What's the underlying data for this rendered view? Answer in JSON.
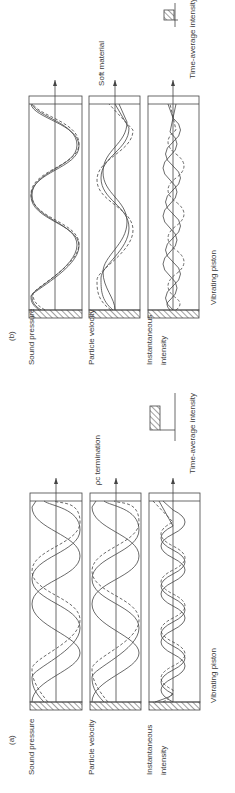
{
  "figure": {
    "rotation": "90deg counter-clockwise",
    "stroke_color": "#4a4a4a",
    "background": "#ffffff"
  },
  "panel_a": {
    "label": "(a)",
    "rows": [
      {
        "label": "Sound pressure"
      },
      {
        "label": "Particle velocity"
      },
      {
        "label_line1": "Instantaneous",
        "label_line2": "intensity"
      }
    ],
    "source_label": "Vibrating piston",
    "termination_label": "ρc termination",
    "legend_label": "Time-average intensity"
  },
  "panel_b": {
    "label": "(b)",
    "rows": [
      {
        "label": "Sound pressure"
      },
      {
        "label": "Particle velocity"
      },
      {
        "label_line1": "Instantaneous",
        "label_line2": "intensity"
      }
    ],
    "source_label": "Vibrating piston",
    "termination_label": "Soft material",
    "legend_label": "Time-average intensity"
  },
  "legend": {
    "solid_line": "waveform at time t1",
    "dashed_line": "waveform at time t2",
    "hatched_bar": "time-average intensity magnitude"
  }
}
